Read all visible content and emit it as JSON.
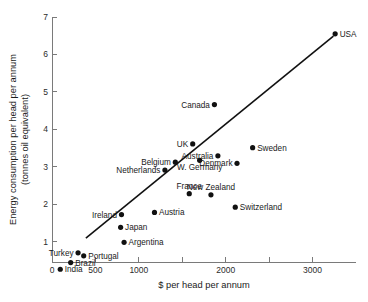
{
  "chart_data": {
    "type": "scatter",
    "title": "",
    "xlabel": "$ per head per annum",
    "ylabel": "Energy consumption per head per annum (tonnes oil equivalent)",
    "ylabel_line1": "Energy consumption per head per annum",
    "ylabel_line2": "(tonnes oil equivalent)",
    "xlim": [
      0,
      3500
    ],
    "ylim": [
      0,
      7
    ],
    "grid": false,
    "legend": "none",
    "xticks": [
      0,
      500,
      1000,
      1500,
      2000,
      2500,
      3000
    ],
    "xtick_labels": [
      "0",
      "500",
      "1000",
      "",
      "2000",
      "",
      "3000"
    ],
    "yticks": [
      1,
      2,
      3,
      4,
      5,
      6,
      7
    ],
    "ytick_labels": [
      "1",
      "2",
      "3",
      "4",
      "5",
      "6",
      "7"
    ],
    "trend_line": {
      "x_start": 390,
      "y_start": 1.09,
      "x_end": 3240,
      "y_end": 6.49
    },
    "points": [
      {
        "name": "USA",
        "x": 3260,
        "y": 6.55,
        "label_side": "right"
      },
      {
        "name": "Canada",
        "x": 1870,
        "y": 4.66,
        "label_side": "left"
      },
      {
        "name": "Sweden",
        "x": 2310,
        "y": 3.51,
        "label_side": "right"
      },
      {
        "name": "UK",
        "x": 1620,
        "y": 3.61,
        "label_side": "left"
      },
      {
        "name": "Australia",
        "x": 1910,
        "y": 3.29,
        "label_side": "left"
      },
      {
        "name": "Denmark",
        "x": 2130,
        "y": 3.09,
        "label_side": "left"
      },
      {
        "name": "Belgium",
        "x": 1420,
        "y": 3.12,
        "label_side": "left"
      },
      {
        "name": "W. Germany",
        "x": 1700,
        "y": 3.17,
        "label_side": "below"
      },
      {
        "name": "Netherlands",
        "x": 1300,
        "y": 2.91,
        "label_side": "left"
      },
      {
        "name": "France",
        "x": 1580,
        "y": 2.28,
        "label_side": "above"
      },
      {
        "name": "New Zealand",
        "x": 1830,
        "y": 2.25,
        "label_side": "above"
      },
      {
        "name": "Switzerland",
        "x": 2110,
        "y": 1.92,
        "label_side": "right"
      },
      {
        "name": "Austria",
        "x": 1180,
        "y": 1.78,
        "label_side": "right"
      },
      {
        "name": "Ireland",
        "x": 800,
        "y": 1.72,
        "label_side": "left"
      },
      {
        "name": "Japan",
        "x": 790,
        "y": 1.38,
        "label_side": "right"
      },
      {
        "name": "Argentina",
        "x": 830,
        "y": 0.98,
        "label_side": "right"
      },
      {
        "name": "Turkey",
        "x": 300,
        "y": 0.7,
        "label_side": "left"
      },
      {
        "name": "Portugal",
        "x": 365,
        "y": 0.62,
        "label_side": "right"
      },
      {
        "name": "Brazil",
        "x": 215,
        "y": 0.44,
        "label_side": "right"
      },
      {
        "name": "India",
        "x": 95,
        "y": 0.26,
        "label_side": "right"
      }
    ]
  }
}
